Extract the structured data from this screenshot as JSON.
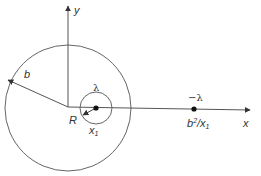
{
  "diagram": {
    "type": "image-charge geometry",
    "labels": {
      "y_axis": "y",
      "x_axis": "x",
      "outer_radius": "b",
      "inner_radius": "R",
      "inner_charge": "λ",
      "image_charge": "−λ",
      "inner_position": "x",
      "inner_position_sub": "1",
      "image_position_base": "b",
      "image_position_sup": "2",
      "image_position_div": "/x",
      "image_position_sub": "1"
    },
    "colors": {
      "stroke": "#555555",
      "dot": "#111111",
      "text": "#333333"
    }
  }
}
